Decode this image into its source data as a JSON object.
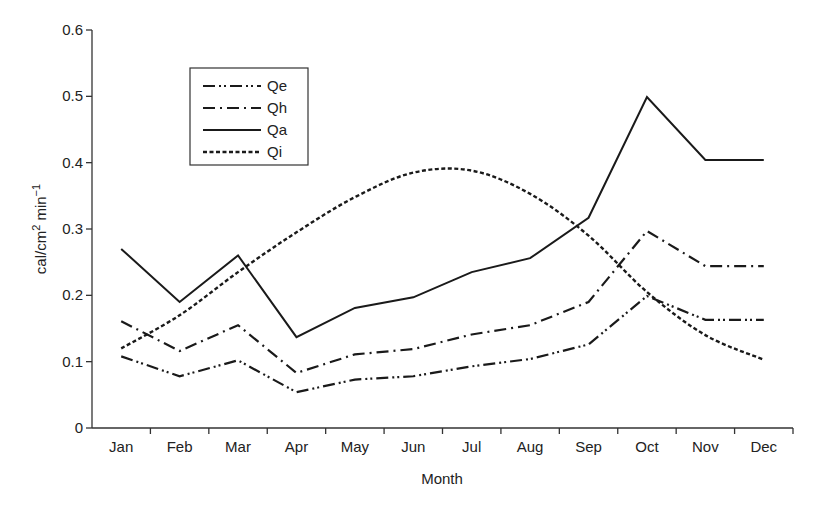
{
  "chart_data": {
    "type": "line",
    "title": "",
    "xlabel": "Month",
    "ylabel": "cal/cm² min⁻¹",
    "ylabel_parts": {
      "base": "cal/cm",
      "sup1": "2",
      "mid": " min",
      "sup2": "−1"
    },
    "categories": [
      "Jan",
      "Feb",
      "Mar",
      "Apr",
      "May",
      "Jun",
      "Jul",
      "Aug",
      "Sep",
      "Oct",
      "Nov",
      "Dec"
    ],
    "ylim": [
      0,
      0.6
    ],
    "yticks": [
      "0",
      "0.1",
      "0.2",
      "0.3",
      "0.4",
      "0.5",
      "0.6"
    ],
    "grid": false,
    "legend_position": "upper-left (inside plot)",
    "series": [
      {
        "name": "Qe",
        "style": "dash-dot-dot",
        "values": [
          0.108,
          0.078,
          0.102,
          0.054,
          0.073,
          0.078,
          0.093,
          0.104,
          0.126,
          0.199,
          0.163,
          0.163
        ]
      },
      {
        "name": "Qh",
        "style": "dash-dot",
        "values": [
          0.161,
          0.116,
          0.155,
          0.083,
          0.111,
          0.119,
          0.141,
          0.155,
          0.19,
          0.297,
          0.244,
          0.244
        ]
      },
      {
        "name": "Qa",
        "style": "solid",
        "values": [
          0.27,
          0.19,
          0.26,
          0.137,
          0.181,
          0.197,
          0.235,
          0.256,
          0.317,
          0.499,
          0.404,
          0.404
        ]
      },
      {
        "name": "Qi",
        "style": "dotted",
        "values": [
          0.12,
          0.17,
          0.235,
          0.295,
          0.348,
          0.385,
          0.388,
          0.353,
          0.29,
          0.205,
          0.14,
          0.103
        ]
      }
    ]
  },
  "colors": {
    "line": "#1a1a1a",
    "axis": "#333333",
    "background": "#ffffff"
  }
}
